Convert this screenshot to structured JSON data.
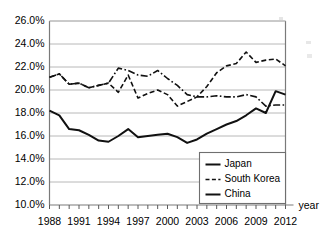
{
  "chart_data": {
    "type": "line",
    "title": "",
    "subtitle": "",
    "xlabel": "year",
    "ylabel": "",
    "grid": true,
    "legend_position": "inside-bottom-right",
    "xlim": [
      1988,
      2012
    ],
    "ylim": [
      10.0,
      26.0
    ],
    "ytick_step": 2.0,
    "xtick_step": 1,
    "xtick_label_step": 3,
    "y_tick_labels": [
      "26.0%",
      "24.0%",
      "22.0%",
      "20.0%",
      "18.0%",
      "16.0%",
      "14.0%",
      "12.0%",
      "10.0%"
    ],
    "y_tick_values": [
      26.0,
      24.0,
      22.0,
      20.0,
      18.0,
      16.0,
      14.0,
      12.0,
      10.0
    ],
    "x_tick_labels": [
      "1988",
      "1991",
      "1994",
      "1997",
      "2000",
      "2003",
      "2006",
      "2009",
      "2012"
    ],
    "x_tick_values": [
      1988,
      1991,
      1994,
      1997,
      2000,
      2003,
      2006,
      2009,
      2012
    ],
    "x": [
      1988,
      1989,
      1990,
      1991,
      1992,
      1993,
      1994,
      1995,
      1996,
      1997,
      1998,
      1999,
      2000,
      2001,
      2002,
      2003,
      2004,
      2005,
      2006,
      2007,
      2008,
      2009,
      2010,
      2011,
      2012
    ],
    "series": [
      {
        "name": "Japan",
        "style": "solid",
        "values": [
          18.2,
          17.8,
          16.6,
          16.5,
          16.1,
          15.6,
          15.5,
          16.0,
          16.6,
          15.9,
          16.0,
          16.1,
          16.2,
          15.9,
          15.4,
          15.7,
          16.2,
          16.6,
          17.0,
          17.3,
          17.8,
          18.4,
          18.0,
          19.9,
          19.6
        ]
      },
      {
        "name": "South Korea",
        "style": "dashed",
        "values": [
          21.1,
          21.4,
          20.5,
          20.6,
          20.2,
          20.4,
          20.6,
          19.8,
          21.3,
          19.3,
          19.7,
          20.0,
          19.6,
          18.6,
          19.0,
          19.4,
          20.3,
          21.5,
          22.1,
          22.3,
          23.3,
          22.4,
          22.6,
          22.7,
          22.1
        ]
      },
      {
        "name": "China",
        "style": "dash-dot",
        "values": [
          21.1,
          21.4,
          20.5,
          20.6,
          20.2,
          20.4,
          20.6,
          21.9,
          21.7,
          21.3,
          21.2,
          21.7,
          21.0,
          20.4,
          19.6,
          19.4,
          19.4,
          19.5,
          19.4,
          19.4,
          19.6,
          19.4,
          18.6,
          18.7,
          18.7
        ]
      }
    ],
    "legend_entries": [
      {
        "label": "Japan",
        "style": "solid"
      },
      {
        "label": "South Korea",
        "style": "dashed"
      },
      {
        "label": "China",
        "style": "solid"
      }
    ]
  },
  "axis_name": {
    "x": "year"
  }
}
